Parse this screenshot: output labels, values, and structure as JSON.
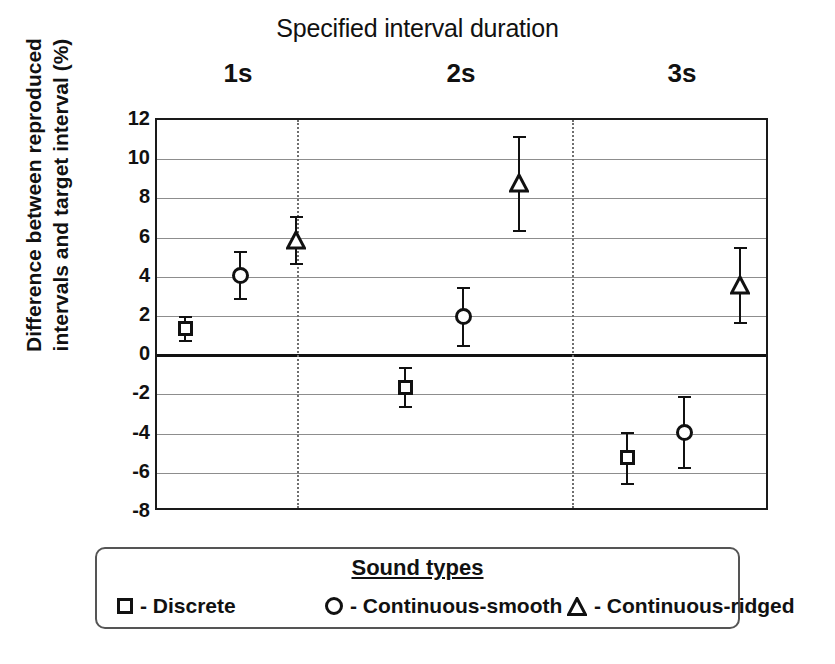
{
  "chart_data": {
    "type": "scatter",
    "title": "Specified interval duration",
    "xlabel": "",
    "ylabel": "Difference between reproduced intervals and target interval (%)",
    "ylabel_lines": [
      "Difference between reproduced",
      "intervals and target interval (%)"
    ],
    "categories": [
      "1s",
      "2s",
      "3s"
    ],
    "ylim": [
      -8,
      12
    ],
    "yticks": [
      12,
      10,
      8,
      6,
      4,
      2,
      0,
      -2,
      -4,
      -6,
      -8
    ],
    "grid": true,
    "zero_line": 0,
    "legend_position": "below-plot",
    "series": [
      {
        "name": "Discrete",
        "marker": "square",
        "values": [
          1.4,
          -1.6,
          -5.2
        ],
        "errors": [
          0.6,
          1.0,
          1.3
        ]
      },
      {
        "name": "Continuous-smooth",
        "marker": "circle",
        "values": [
          4.1,
          2.0,
          -3.9
        ],
        "errors": [
          1.2,
          1.5,
          1.8
        ]
      },
      {
        "name": "Continuous-ridged",
        "marker": "triangle",
        "values": [
          5.9,
          8.8,
          3.6
        ],
        "errors": [
          1.2,
          2.4,
          1.9
        ]
      }
    ]
  },
  "legend": {
    "title": "Sound types",
    "items": [
      {
        "marker": "square",
        "label": "- Discrete"
      },
      {
        "marker": "circle",
        "label": "- Continuous-smooth"
      },
      {
        "marker": "triangle",
        "label": "- Continuous-ridged"
      }
    ]
  },
  "axis": {
    "ticks": [
      "12",
      "10",
      "8",
      "6",
      "4",
      "2",
      "0",
      "-2",
      "-4",
      "-6",
      "-8"
    ]
  },
  "groups": [
    {
      "label": "1s"
    },
    {
      "label": "2s"
    },
    {
      "label": "3s"
    }
  ],
  "colors": {
    "ink": "#111111",
    "grid": "#8d8d8d",
    "separator": "#6f6f6f",
    "background": "#ffffff"
  }
}
